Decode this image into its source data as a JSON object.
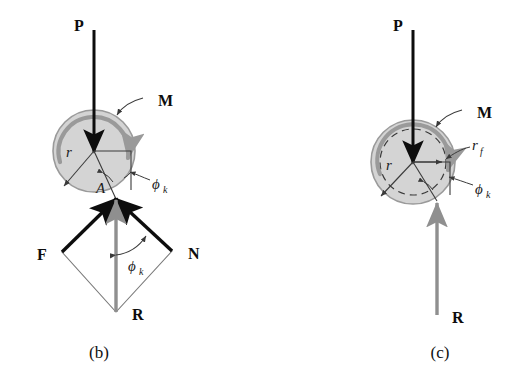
{
  "figure": {
    "title_parts": [
      "(b)",
      "(c)"
    ],
    "colors": {
      "disk_fill": "#d4d4d4",
      "disk_stroke": "#8c8c8c",
      "moment_arrow": "#9a9a9a",
      "force_black": "#0d0d0d",
      "resultant_gray": "#8f8f8f",
      "thin_line": "#5a5a5a",
      "background": "#ffffff"
    },
    "panel_b": {
      "caption": "(b)",
      "labels": {
        "load": "P",
        "moment": "M",
        "radius": "r",
        "contact_point": "A",
        "friction_angle_top": "ϕ",
        "friction_angle_top_sub": "k",
        "friction_force": "F",
        "normal_force": "N",
        "resultant": "R",
        "friction_angle_bottom": "ϕ",
        "friction_angle_bottom_sub": "k"
      },
      "geometry": {
        "circle_center_x": 94,
        "circle_center_y": 151,
        "circle_radius": 41,
        "contact_point_x": 116,
        "contact_point_y": 199,
        "load_arrow_from_y": 30,
        "load_arrow_to_y": 152
      }
    },
    "panel_c": {
      "caption": "(c)",
      "labels": {
        "load": "P",
        "moment": "M",
        "radius": "r",
        "friction_radius": "r",
        "friction_radius_sub": "f",
        "friction_angle": "ϕ",
        "friction_angle_sub": "k",
        "resultant": "R"
      },
      "geometry": {
        "circle_center_x": 413,
        "circle_center_y": 162,
        "circle_radius": 42,
        "friction_circle_radius": 33,
        "contact_point_x": 437,
        "contact_point_y": 201,
        "load_arrow_from_y": 30,
        "load_arrow_to_y": 163,
        "resultant_from_y": 315,
        "resultant_to_y": 203
      }
    }
  }
}
